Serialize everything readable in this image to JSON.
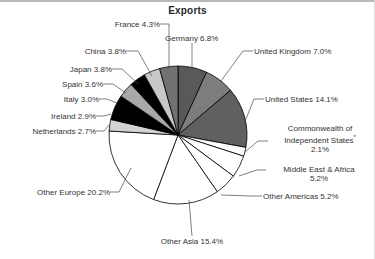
{
  "chart_data": {
    "type": "pie",
    "title": "Exports",
    "xlabel": "",
    "ylabel": "",
    "legend_position": "none",
    "grid": false,
    "units": "percent",
    "footnote_marker": "*",
    "categories": [
      "Germany",
      "United Kingdom",
      "United States",
      "Commonwealth of Independent States*",
      "Middle East & Africa",
      "Other Americas",
      "Other Asia",
      "Other Europe",
      "Netherlands",
      "Ireland",
      "Italy",
      "Spain",
      "Japan",
      "China",
      "France"
    ],
    "values": [
      6.8,
      7.0,
      14.1,
      2.1,
      5.2,
      5.2,
      15.4,
      20.2,
      2.7,
      2.9,
      3.0,
      3.6,
      3.8,
      3.8,
      4.3
    ],
    "slice_colors": [
      "#59595b",
      "#7d7d7f",
      "#606062",
      "#ffffff",
      "#ffffff",
      "#ffffff",
      "#ffffff",
      "#ffffff",
      "#d3d3d3",
      "#000000",
      "#000000",
      "#a8a8a8",
      "#000000",
      "#c8c8c8",
      "#717173"
    ]
  },
  "labels": {
    "title": "Exports",
    "france": "France 4.3%",
    "china": "China 3.8%",
    "japan": "Japan 3.8%",
    "spain": "Spain 3.6%",
    "italy": "Italy 3.0%",
    "ireland": "Ireland 2.9%",
    "netherlands": "Netherlands 2.7%",
    "other_europe": "Other Europe 20.2%",
    "other_asia": "Other Asia 15.4%",
    "germany": "Germany 6.8%",
    "united_kingdom": "United Kingdom 7.0%",
    "united_states": "United States 14.1%",
    "cis_line1": "Commonwealth of",
    "cis_line2": "Independent States",
    "cis_marker": "*",
    "cis_value": "2.1%",
    "middle_east_africa_line1": "Middle East & Africa",
    "middle_east_africa_value": "5.2%",
    "other_americas": "Other Americas 5.2%"
  }
}
